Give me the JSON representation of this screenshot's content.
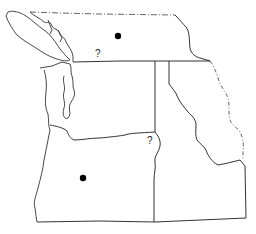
{
  "map": {
    "type": "outline-map",
    "region": "Pacific Northwest",
    "colors": {
      "background": "#ffffff",
      "lines": "#333333",
      "markers": "#000000"
    },
    "markers": [
      {
        "kind": "dot",
        "x": 118,
        "y": 36
      },
      {
        "kind": "dot",
        "x": 83,
        "y": 178
      }
    ],
    "labels": [
      {
        "id": "question-north",
        "text": "?",
        "x": 95,
        "y": 49
      },
      {
        "id": "question-east",
        "text": "?",
        "x": 147,
        "y": 136
      }
    ]
  }
}
